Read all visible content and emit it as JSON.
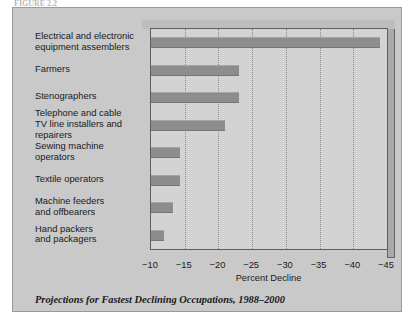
{
  "top_fragment": "FIGURE 2.2",
  "caption": "Projections for Fastest Declining Occupations, 1988–2000",
  "chart_data": {
    "type": "bar",
    "orientation": "horizontal",
    "title": "",
    "xlabel": "Percent Decline",
    "ylabel": "",
    "xlim": [
      -10,
      -45
    ],
    "xticks": [
      -10,
      -15,
      -20,
      -25,
      -30,
      -35,
      -40,
      -45
    ],
    "xtick_labels": [
      "−10",
      "−15",
      "−20",
      "−25",
      "−30",
      "−35",
      "−40",
      "−45"
    ],
    "grid": "vertical-dotted",
    "legend": "none",
    "bar_color": "#8d8d8d",
    "plot_bg": "#d3d3d3",
    "figure_bg": "#c9c9c9",
    "categories": [
      "Electrical and electronic equipment assemblers",
      "Farmers",
      "Stenographers",
      "Telephone and cable TV line installers and repairers",
      "Sewing machine operators",
      "Textile operators",
      "Machine feeders and offbearers",
      "Hand packers and packagers"
    ],
    "category_lines": [
      [
        "Electrical and electronic",
        "equipment assemblers"
      ],
      [
        "Farmers"
      ],
      [
        "Stenographers"
      ],
      [
        "Telephone and cable",
        "TV line installers and",
        "repairers"
      ],
      [
        "Sewing machine",
        "operators"
      ],
      [
        "Textile operators"
      ],
      [
        "Machine feeders",
        "and offbearers"
      ],
      [
        "Hand packers",
        "and packagers"
      ]
    ],
    "values": [
      -44,
      -23,
      -23,
      -21,
      -14.3,
      -14.3,
      -13.2,
      -12
    ]
  }
}
